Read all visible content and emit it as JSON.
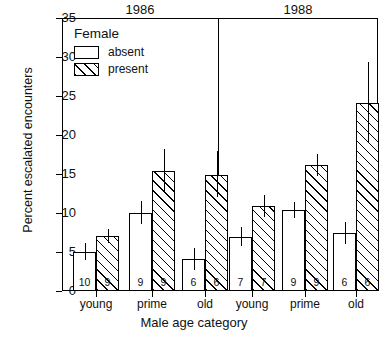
{
  "chart_data": {
    "type": "bar",
    "title": "",
    "xlabel": "Male age category",
    "ylabel": "Percent escalated encounters",
    "ylim": [
      0,
      35
    ],
    "yticks": [
      0,
      5,
      10,
      15,
      20,
      25,
      30,
      35
    ],
    "grid": false,
    "legend": {
      "title": "Female",
      "position": "top-left-inside",
      "entries": [
        {
          "label": "absent",
          "pattern": "solid-white"
        },
        {
          "label": "present",
          "pattern": "diagonal-hatch"
        }
      ]
    },
    "panels": [
      {
        "label": "1986"
      },
      {
        "label": "1988"
      }
    ],
    "categories": [
      "young",
      "prime",
      "old",
      "young",
      "prime",
      "old"
    ],
    "groups": [
      {
        "panel": "1986",
        "category": "young",
        "bars": [
          {
            "series": "absent",
            "value": 5.0,
            "err_low": 4.0,
            "err_high": 6.1,
            "n": "10"
          },
          {
            "series": "present",
            "value": 7.0,
            "err_low": 6.2,
            "err_high": 7.9,
            "n": "9"
          }
        ]
      },
      {
        "panel": "1986",
        "category": "prime",
        "bars": [
          {
            "series": "absent",
            "value": 10.0,
            "err_low": 8.6,
            "err_high": 11.5,
            "n": "9"
          },
          {
            "series": "present",
            "value": 15.4,
            "err_low": 12.6,
            "err_high": 18.2,
            "n": "9"
          }
        ]
      },
      {
        "panel": "1986",
        "category": "old",
        "bars": [
          {
            "series": "absent",
            "value": 4.1,
            "err_low": 2.7,
            "err_high": 5.5,
            "n": "6"
          },
          {
            "series": "present",
            "value": 14.9,
            "err_low": 12.0,
            "err_high": 18.0,
            "n": "6"
          }
        ]
      },
      {
        "panel": "1988",
        "category": "young",
        "bars": [
          {
            "series": "absent",
            "value": 6.9,
            "err_low": 5.8,
            "err_high": 8.2,
            "n": "7"
          },
          {
            "series": "present",
            "value": 10.9,
            "err_low": 9.5,
            "err_high": 12.3,
            "n": "7"
          }
        ]
      },
      {
        "panel": "1988",
        "category": "prime",
        "bars": [
          {
            "series": "absent",
            "value": 10.4,
            "err_low": 9.4,
            "err_high": 11.4,
            "n": "9"
          },
          {
            "series": "present",
            "value": 16.1,
            "err_low": 14.7,
            "err_high": 17.6,
            "n": "9"
          }
        ]
      },
      {
        "panel": "1988",
        "category": "old",
        "bars": [
          {
            "series": "absent",
            "value": 7.4,
            "err_low": 6.0,
            "err_high": 8.8,
            "n": "6"
          },
          {
            "series": "present",
            "value": 24.1,
            "err_low": 19.0,
            "err_high": 29.4,
            "n": "6"
          }
        ]
      }
    ]
  },
  "axis": {
    "y_tick_labels": [
      "0",
      "5",
      "10",
      "15",
      "20",
      "25",
      "30",
      "35"
    ],
    "x_tick_labels": [
      "young",
      "prime",
      "old",
      "young",
      "prime",
      "old"
    ],
    "x_title": "Male age category",
    "y_title": "Percent escalated encounters"
  },
  "panels": {
    "left_label": "1986",
    "right_label": "1988"
  },
  "legend": {
    "title": "Female",
    "absent_label": "absent",
    "present_label": "present"
  },
  "colors": {
    "axis": "#000000",
    "bar_fill": "#ffffff",
    "hatch": "#000000",
    "background": "#ffffff"
  }
}
